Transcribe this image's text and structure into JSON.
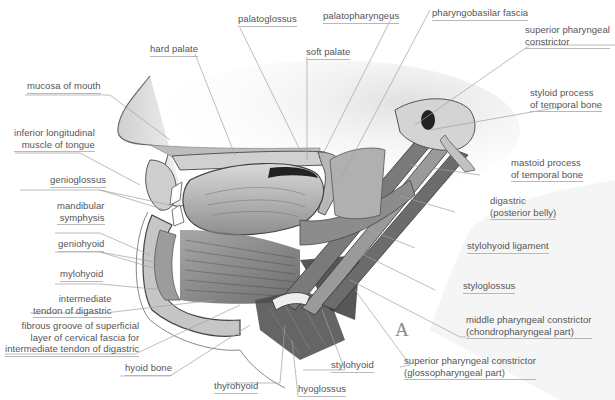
{
  "figure": {
    "plate_letter": "A",
    "colors": {
      "background": "#ffffff",
      "label_text": "#555555",
      "leader_line": "#9a9a9a"
    }
  },
  "labels": {
    "palatoglossus": "palatoglossus",
    "hard_palate": "hard palate",
    "soft_palate": "soft palate",
    "palatopharyngeus": "palatopharyngeus",
    "pharyngobasilar_fascia": "pharyngobasilar fascia",
    "superior_pharyngeal_constrictor": [
      "superior pharyngeal",
      "constrictor"
    ],
    "mucosa_of_mouth": "mucosa of mouth",
    "inferior_longitudinal": [
      "inferior longitudinal",
      "muscle of tongue"
    ],
    "genioglossus": "genioglossus",
    "mandibular_symphysis": [
      "mandibular",
      "symphysis"
    ],
    "geniohyoid": "geniohyoid",
    "mylohyoid": "mylohyoid",
    "intermediate_tendon": [
      "intermediate",
      "tendon of digastric"
    ],
    "fibrous_groove": [
      "fibrous groove of superficial",
      "layer of cervical fascia for",
      "intermediate tendon of digastric"
    ],
    "hyoid_bone": "hyoid bone",
    "thyrohyoid": "thyrohyoid",
    "hyoglossus": "hyoglossus",
    "stylohyoid": "stylohyoid",
    "superior_constrictor_glosso": [
      "superior pharyngeal constrictor",
      "(glossopharyngeal part)"
    ],
    "middle_constrictor": [
      "middle pharyngeal constrictor",
      "(chondropharyngeal part)"
    ],
    "styloglossus": "styloglossus",
    "stylohyoid_ligament": "stylohyoid ligament",
    "digastric_posterior": [
      "digastric",
      "(posterior belly)"
    ],
    "mastoid_process": [
      "mastoid process",
      "of temporal bone"
    ],
    "styloid_process": [
      "styloid process",
      "of temporal bone"
    ]
  }
}
